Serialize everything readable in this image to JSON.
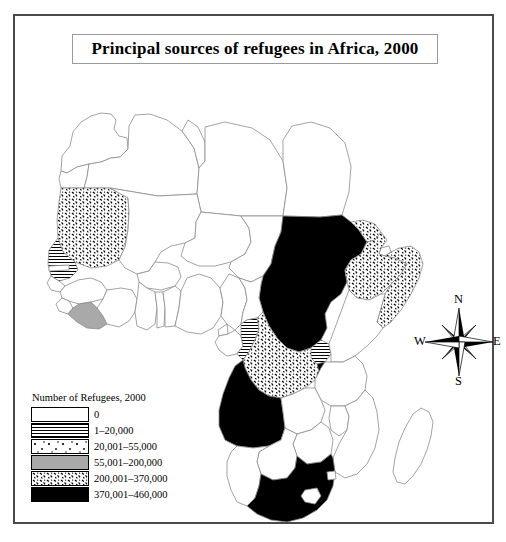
{
  "title": {
    "text": "Principal sources of refugees in Africa, 2000"
  },
  "legend": {
    "heading": "Number of Refugees, 2000",
    "entries": [
      {
        "label": "0",
        "pattern": "white",
        "swatch_class": "pat-none"
      },
      {
        "label": "1–20,000",
        "pattern": "horizontal-lines",
        "swatch_class": "pat-hlines"
      },
      {
        "label": "20,001–55,000",
        "pattern": "sparse-speckle",
        "swatch_class": "pat-sparse"
      },
      {
        "label": "55,001–200,000",
        "pattern": "solid-gray",
        "swatch_class": "pat-gray"
      },
      {
        "label": "200,001–370,000",
        "pattern": "dense-speckle",
        "swatch_class": "pat-dense"
      },
      {
        "label": "370,001–460,000",
        "pattern": "solid-black",
        "swatch_class": "pat-solid"
      }
    ]
  },
  "compass": {
    "north": "N",
    "east": "E",
    "south": "S",
    "west": "W"
  },
  "colors": {
    "frame": "#4a4a4a",
    "outline": "#808080",
    "solid_black": "#000000",
    "solid_gray": "#a9a9a9",
    "background": "#ffffff"
  },
  "map_data": {
    "type": "choropleth",
    "region": "Africa",
    "year": 2000,
    "measure": "Number of Refugees",
    "countries": [
      {
        "name": "Morocco",
        "class": "0"
      },
      {
        "name": "Western Sahara",
        "class": "0"
      },
      {
        "name": "Algeria",
        "class": "0"
      },
      {
        "name": "Tunisia",
        "class": "0"
      },
      {
        "name": "Libya",
        "class": "0"
      },
      {
        "name": "Egypt",
        "class": "0"
      },
      {
        "name": "Mauritania",
        "class": "200,001–370,000"
      },
      {
        "name": "Senegal",
        "class": "1–20,000"
      },
      {
        "name": "Gambia",
        "class": "0"
      },
      {
        "name": "Guinea-Bissau",
        "class": "0"
      },
      {
        "name": "Guinea",
        "class": "0"
      },
      {
        "name": "Sierra Leone",
        "class": "0"
      },
      {
        "name": "Liberia",
        "class": "55,001–200,000"
      },
      {
        "name": "Ivory Coast",
        "class": "0"
      },
      {
        "name": "Mali",
        "class": "0"
      },
      {
        "name": "Burkina Faso",
        "class": "0"
      },
      {
        "name": "Ghana",
        "class": "0"
      },
      {
        "name": "Togo",
        "class": "0"
      },
      {
        "name": "Benin",
        "class": "0"
      },
      {
        "name": "Niger",
        "class": "0"
      },
      {
        "name": "Nigeria",
        "class": "0"
      },
      {
        "name": "Chad",
        "class": "0"
      },
      {
        "name": "Sudan",
        "class": "370,001–460,000"
      },
      {
        "name": "Eritrea",
        "class": "200,001–370,000"
      },
      {
        "name": "Djibouti",
        "class": "0"
      },
      {
        "name": "Ethiopia",
        "class": "200,001–370,000"
      },
      {
        "name": "Somalia",
        "class": "200,001–370,000"
      },
      {
        "name": "Cameroon",
        "class": "0"
      },
      {
        "name": "Central African Republic",
        "class": "0"
      },
      {
        "name": "Equatorial Guinea",
        "class": "0"
      },
      {
        "name": "Gabon",
        "class": "0"
      },
      {
        "name": "Republic of the Congo",
        "class": "1–20,000"
      },
      {
        "name": "Democratic Republic of the Congo",
        "class": "200,001–370,000"
      },
      {
        "name": "Uganda",
        "class": "1–20,000"
      },
      {
        "name": "Rwanda",
        "class": "370,001–460,000"
      },
      {
        "name": "Burundi",
        "class": "370,001–460,000"
      },
      {
        "name": "Kenya",
        "class": "0"
      },
      {
        "name": "Tanzania",
        "class": "0"
      },
      {
        "name": "Angola",
        "class": "370,001–460,000"
      },
      {
        "name": "Zambia",
        "class": "0"
      },
      {
        "name": "Malawi",
        "class": "0"
      },
      {
        "name": "Mozambique",
        "class": "0"
      },
      {
        "name": "Zimbabwe",
        "class": "0"
      },
      {
        "name": "Botswana",
        "class": "0"
      },
      {
        "name": "Namibia",
        "class": "0"
      },
      {
        "name": "South Africa",
        "class": "370,001–460,000"
      },
      {
        "name": "Lesotho",
        "class": "0"
      },
      {
        "name": "Swaziland",
        "class": "0"
      },
      {
        "name": "Madagascar",
        "class": "0"
      }
    ]
  }
}
